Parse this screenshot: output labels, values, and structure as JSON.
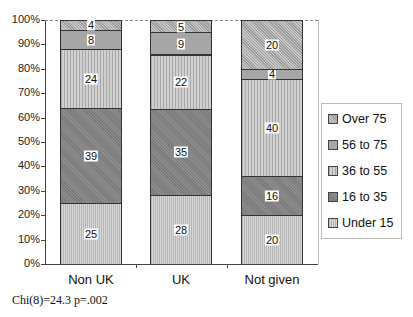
{
  "chart_data": {
    "type": "bar",
    "stacked": true,
    "percent": true,
    "title": "",
    "xlabel": "",
    "ylabel": "",
    "ylim": [
      0,
      100
    ],
    "yticks": [
      "0%",
      "10%",
      "20%",
      "30%",
      "40%",
      "50%",
      "60%",
      "70%",
      "80%",
      "90%",
      "100%"
    ],
    "categories": [
      "Non UK",
      "UK",
      "Not given"
    ],
    "series": [
      {
        "name": "Under 15",
        "values": [
          25,
          28,
          20
        ],
        "pattern": "under15"
      },
      {
        "name": "16 to 35",
        "values": [
          39,
          35,
          16
        ],
        "pattern": "16to35"
      },
      {
        "name": "36 to 55",
        "values": [
          24,
          22,
          40
        ],
        "pattern": "36to55"
      },
      {
        "name": "56 to 75",
        "values": [
          8,
          9,
          4
        ],
        "pattern": "56to75"
      },
      {
        "name": "Over 75",
        "values": [
          4,
          5,
          20
        ],
        "pattern": "over75"
      }
    ],
    "legend": {
      "position": "right",
      "entries": [
        "Over 75",
        "56 to 75",
        "36 to 55",
        "16 to 35",
        "Under 15"
      ]
    },
    "annotation": "Chi(8)=24.3 p=.002",
    "grid": false
  }
}
